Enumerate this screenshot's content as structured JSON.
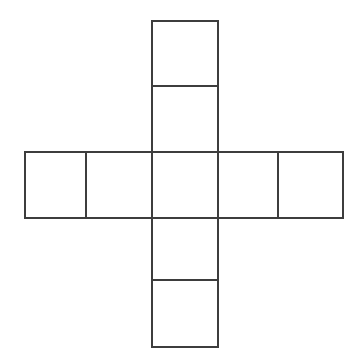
{
  "figure": {
    "type": "geometry-diagram",
    "background_color": "#ffffff",
    "stroke_color": "#3d3d3d",
    "stroke_width": 2,
    "fill_color": "#ffffff",
    "canvas": {
      "width": 363,
      "height": 364
    },
    "grid": {
      "columns": 5,
      "rows": 5,
      "cell_width": 63.6,
      "cell_height": 65.2,
      "origin_x": 25,
      "origin_y": 21,
      "vertical_strip_x": 152,
      "vertical_strip_width": 66,
      "horizontal_band_y": 152,
      "horizontal_band_height": 66
    },
    "cells": [
      {
        "name": "top-cell-1",
        "x": 152,
        "y": 21,
        "width": 66,
        "height": 65
      },
      {
        "name": "top-cell-2",
        "x": 152,
        "y": 86,
        "width": 66,
        "height": 66
      },
      {
        "name": "left-cell-1",
        "x": 25,
        "y": 152,
        "width": 61,
        "height": 66
      },
      {
        "name": "left-cell-2",
        "x": 86,
        "y": 152,
        "width": 66,
        "height": 66
      },
      {
        "name": "center-cell",
        "x": 152,
        "y": 152,
        "width": 66,
        "height": 66
      },
      {
        "name": "right-cell-1",
        "x": 218,
        "y": 152,
        "width": 60,
        "height": 66
      },
      {
        "name": "right-cell-2",
        "x": 278,
        "y": 152,
        "width": 65,
        "height": 66
      },
      {
        "name": "bottom-cell-1",
        "x": 152,
        "y": 218,
        "width": 66,
        "height": 62
      },
      {
        "name": "bottom-cell-2",
        "x": 152,
        "y": 280,
        "width": 66,
        "height": 67
      }
    ],
    "edges": [
      {
        "name": "vertical-strip-left-edge",
        "x1": 152,
        "y1": 21,
        "x2": 152,
        "y2": 347
      },
      {
        "name": "vertical-strip-right-edge",
        "x1": 218,
        "y1": 21,
        "x2": 218,
        "y2": 347
      },
      {
        "name": "vertical-strip-top-edge",
        "x1": 152,
        "y1": 21,
        "x2": 218,
        "y2": 21
      },
      {
        "name": "vertical-strip-bottom-edge",
        "x1": 152,
        "y1": 347,
        "x2": 218,
        "y2": 347
      },
      {
        "name": "top-divider-line",
        "x1": 152,
        "y1": 86,
        "x2": 218,
        "y2": 86
      },
      {
        "name": "bottom-divider-line",
        "x1": 152,
        "y1": 280,
        "x2": 218,
        "y2": 280
      },
      {
        "name": "horizontal-band-top-edge",
        "x1": 25,
        "y1": 152,
        "x2": 343,
        "y2": 152
      },
      {
        "name": "horizontal-band-bottom-edge",
        "x1": 25,
        "y1": 218,
        "x2": 343,
        "y2": 218
      },
      {
        "name": "horizontal-band-left-edge",
        "x1": 25,
        "y1": 152,
        "x2": 25,
        "y2": 218
      },
      {
        "name": "horizontal-band-right-edge",
        "x1": 343,
        "y1": 152,
        "x2": 343,
        "y2": 218
      },
      {
        "name": "left-divider-line",
        "x1": 86,
        "y1": 152,
        "x2": 86,
        "y2": 218
      },
      {
        "name": "right-divider-line",
        "x1": 278,
        "y1": 152,
        "x2": 278,
        "y2": 218
      }
    ]
  }
}
